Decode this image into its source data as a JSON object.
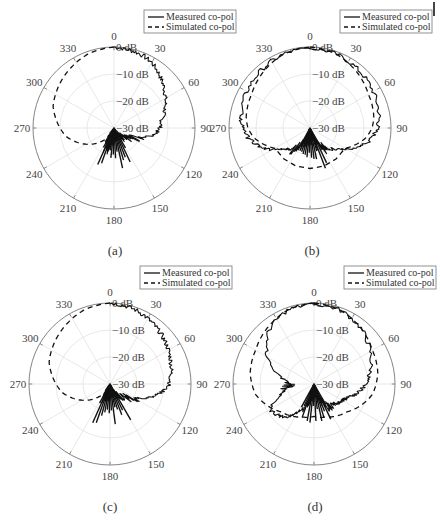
{
  "figure": {
    "panels": [
      {
        "id": "a",
        "caption": "(a)",
        "center": [
          114,
          128
        ],
        "caption_pos": [
          115,
          250
        ]
      },
      {
        "id": "b",
        "caption": "(b)",
        "center": [
          310,
          128
        ],
        "caption_pos": [
          312,
          250
        ]
      },
      {
        "id": "c",
        "caption": "(c)",
        "center": [
          110,
          384
        ],
        "caption_pos": [
          110,
          508
        ]
      },
      {
        "id": "d",
        "caption": "(d)",
        "center": [
          314,
          384
        ],
        "caption_pos": [
          315,
          508
        ]
      }
    ],
    "legend": {
      "measured": "Measured co-pol",
      "simulated": "Simulated co-pol"
    },
    "angle_ticks": [
      "0",
      "30",
      "60",
      "90",
      "120",
      "150",
      "180",
      "210",
      "240",
      "270",
      "300",
      "330"
    ],
    "radial_ticks": [
      "0 dB",
      "-10 dB",
      "-20 dB",
      "-30 dB"
    ]
  },
  "chart_data": [
    {
      "type": "polar-line",
      "panel": "(a)",
      "theta_deg_ticks": [
        0,
        30,
        60,
        90,
        120,
        150,
        180,
        210,
        240,
        270,
        300,
        330
      ],
      "r_ticks_dB": [
        0,
        -10,
        -20,
        -30
      ],
      "rlim": [
        -30,
        0
      ],
      "theta_zero": "top",
      "theta_direction": "clockwise",
      "legend": [
        "Measured co-pol",
        "Simulated co-pol"
      ],
      "series": [
        {
          "name": "Measured co-pol",
          "style": "solid",
          "theta": [
            0,
            10,
            20,
            30,
            40,
            50,
            60,
            70,
            80,
            90,
            100,
            110,
            120,
            130,
            140,
            150,
            160,
            170,
            180,
            190,
            200,
            210,
            220,
            230
          ],
          "r_dB": [
            0,
            -0.5,
            -1,
            -2,
            -4,
            -6,
            -8,
            -10,
            -12,
            -13,
            -15,
            -20,
            -22,
            -24,
            -26,
            -27,
            -28,
            -29,
            -30,
            -24,
            -22,
            -25,
            -30,
            -30
          ]
        },
        {
          "name": "Simulated co-pol",
          "style": "dashed",
          "theta": [
            0,
            -10,
            -20,
            -30,
            -40,
            -50,
            -60,
            -70,
            -80,
            -90,
            -100,
            -110,
            -120,
            -130,
            -140,
            -150
          ],
          "r_dB": [
            0,
            -0.5,
            -1,
            -2,
            -3,
            -4,
            -5,
            -6,
            -8,
            -10,
            -12,
            -15,
            -18,
            -21,
            -24,
            -26
          ]
        }
      ]
    },
    {
      "type": "polar-line",
      "panel": "(b)",
      "theta_deg_ticks": [
        0,
        30,
        60,
        90,
        120,
        150,
        180,
        210,
        240,
        270,
        300,
        330
      ],
      "r_ticks_dB": [
        0,
        -10,
        -20,
        -30
      ],
      "rlim": [
        -30,
        0
      ],
      "legend": [
        "Measured co-pol",
        "Simulated co-pol"
      ],
      "series": [
        {
          "name": "Measured co-pol",
          "style": "solid",
          "theta": [
            0,
            20,
            40,
            60,
            80,
            90,
            100,
            110,
            120,
            130,
            140,
            150,
            160,
            170,
            180,
            190,
            200,
            210,
            220,
            230,
            240,
            250,
            260,
            270,
            280,
            300,
            320,
            340,
            360
          ],
          "r_dB": [
            -0.5,
            -1,
            -2,
            -3,
            -4,
            -5,
            -7,
            -10,
            -14,
            -18,
            -20,
            -22,
            -24,
            -25,
            -27,
            -25,
            -24,
            -22,
            -20,
            -18,
            -14,
            -10,
            -7,
            -5,
            -4,
            -3,
            -2,
            -1,
            -0.5
          ]
        },
        {
          "name": "Simulated co-pol",
          "style": "dashed",
          "theta": [
            0,
            20,
            40,
            60,
            80,
            90,
            100,
            110,
            120,
            240,
            250,
            260,
            270,
            280,
            300,
            320,
            340,
            360
          ],
          "r_dB": [
            0,
            -1,
            -3,
            -5,
            -6,
            -7,
            -9,
            -12,
            -15,
            -15,
            -12,
            -9,
            -7,
            -6,
            -5,
            -3,
            -1,
            0
          ]
        }
      ]
    },
    {
      "type": "polar-line",
      "panel": "(c)",
      "theta_deg_ticks": [
        0,
        30,
        60,
        90,
        120,
        150,
        180,
        210,
        240,
        270,
        300,
        330
      ],
      "r_ticks_dB": [
        0,
        -10,
        -20,
        -30
      ],
      "rlim": [
        -30,
        0
      ],
      "legend": [
        "Measured co-pol",
        "Simulated co-pol"
      ],
      "series": [
        {
          "name": "Measured co-pol",
          "style": "solid",
          "theta": [
            0,
            10,
            20,
            30,
            40,
            50,
            60,
            70,
            80,
            90,
            100,
            110,
            120,
            130,
            140,
            150,
            160,
            170,
            180,
            190,
            200,
            210,
            220
          ],
          "r_dB": [
            0,
            -0.5,
            -1,
            -2,
            -3,
            -4,
            -5,
            -6,
            -7,
            -8,
            -11,
            -15,
            -20,
            -22,
            -24,
            -26,
            -27,
            -28,
            -27,
            -25,
            -24,
            -28,
            -30
          ]
        },
        {
          "name": "Simulated co-pol",
          "style": "dashed",
          "theta": [
            0,
            -10,
            -20,
            -30,
            -40,
            -50,
            -60,
            -70,
            -80,
            -90,
            -100,
            -110,
            -120,
            -130,
            -140,
            -150
          ],
          "r_dB": [
            0,
            -0.5,
            -1,
            -2,
            -3,
            -4,
            -5,
            -6,
            -8,
            -10,
            -12,
            -15,
            -18,
            -21,
            -24,
            -26
          ]
        }
      ]
    },
    {
      "type": "polar-line",
      "panel": "(d)",
      "theta_deg_ticks": [
        0,
        30,
        60,
        90,
        120,
        150,
        180,
        210,
        240,
        270,
        300,
        330
      ],
      "r_ticks_dB": [
        0,
        -10,
        -20,
        -30
      ],
      "rlim": [
        -30,
        0
      ],
      "legend": [
        "Measured co-pol",
        "Simulated co-pol"
      ],
      "series": [
        {
          "name": "Measured co-pol",
          "style": "solid",
          "theta": [
            0,
            20,
            40,
            60,
            80,
            90,
            100,
            110,
            120,
            130,
            140,
            150,
            160,
            170,
            180,
            190,
            200,
            210,
            220,
            230,
            240,
            250,
            260,
            270,
            280,
            300,
            320,
            340,
            360
          ],
          "r_dB": [
            -0.5,
            -1,
            -3,
            -6,
            -9,
            -11,
            -13,
            -16,
            -18,
            -19,
            -20,
            -21,
            -24,
            -26,
            -29,
            -26,
            -22,
            -18,
            -14,
            -12,
            -11,
            -16,
            -20,
            -22,
            -18,
            -10,
            -4,
            -1,
            -0.5
          ]
        },
        {
          "name": "Simulated co-pol",
          "style": "dashed",
          "theta": [
            0,
            20,
            40,
            60,
            80,
            90,
            100,
            110,
            120,
            130,
            140,
            150,
            160,
            170,
            180,
            190,
            200,
            210,
            220,
            230,
            240,
            250,
            260,
            270,
            280,
            300,
            320,
            340,
            360
          ],
          "r_dB": [
            0,
            -1,
            -3,
            -5,
            -6,
            -7,
            -8,
            -10,
            -12,
            -14,
            -15,
            -16,
            -17,
            -17.5,
            -18,
            -17.5,
            -17,
            -16,
            -15,
            -14,
            -12,
            -10,
            -8,
            -7,
            -6,
            -5,
            -3,
            -1,
            0
          ]
        }
      ]
    }
  ]
}
